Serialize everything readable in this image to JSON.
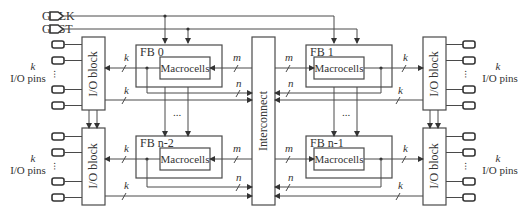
{
  "diagram": {
    "type": "CPLD architecture block diagram",
    "global_signals": [
      {
        "id": "gclk",
        "label": "GCLK"
      },
      {
        "id": "grst",
        "label": "GRST"
      }
    ],
    "function_blocks": [
      {
        "id": "fb0",
        "label": "FB 0",
        "inner": "Macrocells"
      },
      {
        "id": "fb1",
        "label": "FB 1",
        "inner": "Macrocells"
      },
      {
        "id": "fbn2",
        "label": "FB n-2",
        "inner": "Macrocells"
      },
      {
        "id": "fbn1",
        "label": "FB n-1",
        "inner": "Macrocells"
      }
    ],
    "io_blocks": [
      {
        "id": "io_tl",
        "label": "I/O block"
      },
      {
        "id": "io_bl",
        "label": "I/O block"
      },
      {
        "id": "io_tr",
        "label": "I/O block"
      },
      {
        "id": "io_br",
        "label": "I/O block"
      }
    ],
    "interconnect": {
      "label": "Interconnect"
    },
    "pin_groups": [
      {
        "id": "pins_tl",
        "count_label": "k",
        "label": "I/O pins"
      },
      {
        "id": "pins_bl",
        "count_label": "k",
        "label": "I/O pins"
      },
      {
        "id": "pins_tr",
        "count_label": "k",
        "label": "I/O pins"
      },
      {
        "id": "pins_br",
        "count_label": "k",
        "label": "I/O pins"
      }
    ],
    "bus_labels": {
      "k": "k",
      "m": "m",
      "n": "n"
    },
    "ellipsis": "..."
  }
}
